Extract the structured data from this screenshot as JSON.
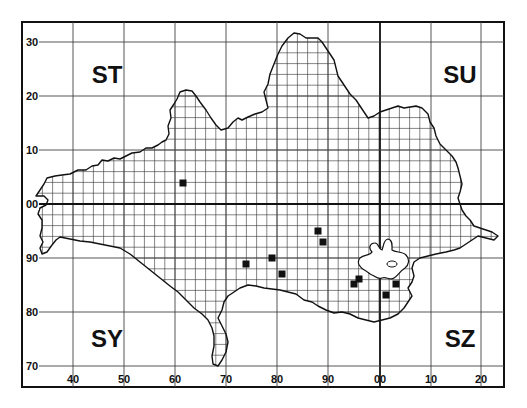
{
  "map": {
    "title": "",
    "grid_squares": [
      {
        "label": "ST",
        "x": 107,
        "y": 83
      },
      {
        "label": "SU",
        "x": 460,
        "y": 83
      },
      {
        "label": "SY",
        "x": 107,
        "y": 347
      },
      {
        "label": "SZ",
        "x": 460,
        "y": 347
      }
    ],
    "x_axis": {
      "ticks": [
        {
          "label": "40",
          "x": 73
        },
        {
          "label": "50",
          "x": 124
        },
        {
          "label": "60",
          "x": 175
        },
        {
          "label": "70",
          "x": 226
        },
        {
          "label": "80",
          "x": 277
        },
        {
          "label": "90",
          "x": 328
        },
        {
          "label": "00",
          "x": 380
        },
        {
          "label": "10",
          "x": 431
        },
        {
          "label": "20",
          "x": 481
        }
      ]
    },
    "y_axis": {
      "ticks": [
        {
          "label": "30",
          "y": 42
        },
        {
          "label": "20",
          "y": 96
        },
        {
          "label": "10",
          "y": 150
        },
        {
          "label": "00",
          "y": 204
        },
        {
          "label": "90",
          "y": 258
        },
        {
          "label": "80",
          "y": 312
        },
        {
          "label": "70",
          "y": 366
        }
      ]
    },
    "frame": {
      "left": 22,
      "top": 22,
      "right": 504,
      "bottom": 387
    },
    "colors": {
      "ink": "#111111",
      "background": "#ffffff"
    },
    "records": [
      {
        "x": 183,
        "y": 183
      },
      {
        "x": 246,
        "y": 264
      },
      {
        "x": 272,
        "y": 258
      },
      {
        "x": 282,
        "y": 274
      },
      {
        "x": 318,
        "y": 231
      },
      {
        "x": 323,
        "y": 242
      },
      {
        "x": 354,
        "y": 284
      },
      {
        "x": 359,
        "y": 279
      },
      {
        "x": 386,
        "y": 295
      },
      {
        "x": 396,
        "y": 284
      }
    ],
    "record_marker": "filled-square",
    "legend": []
  }
}
